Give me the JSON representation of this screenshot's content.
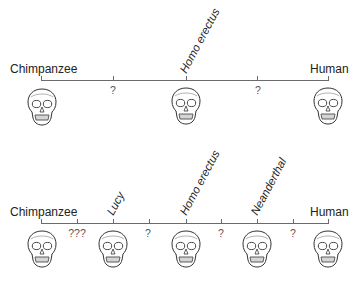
{
  "colors": {
    "line": "#6b6b6b",
    "text": "#222222",
    "skull_stroke": "#333333",
    "accent_green": "#4caf50",
    "accent_blue": "#4a6fd1",
    "accent_red": "#c0392b"
  },
  "top_panel": {
    "start_label": "Chimpanzee",
    "end_label": "Human",
    "named_nodes": [
      {
        "label": "Homo erectus"
      }
    ],
    "gaps": [
      "?",
      "?"
    ],
    "skulls": [
      "chimpanzee-skull",
      "homo-erectus-skull",
      "human-skull"
    ]
  },
  "bottom_panel": {
    "start_label": "Chimpanzee",
    "end_label": "Human",
    "named_nodes": [
      {
        "label": "Lucy"
      },
      {
        "label": "Homo erectus"
      },
      {
        "label": "Neanderthal"
      }
    ],
    "gaps": [
      "???",
      "?",
      "?",
      "?"
    ],
    "skulls": [
      "chimpanzee-skull",
      "lucy-skull",
      "homo-erectus-skull",
      "neanderthal-skull",
      "human-skull"
    ]
  }
}
